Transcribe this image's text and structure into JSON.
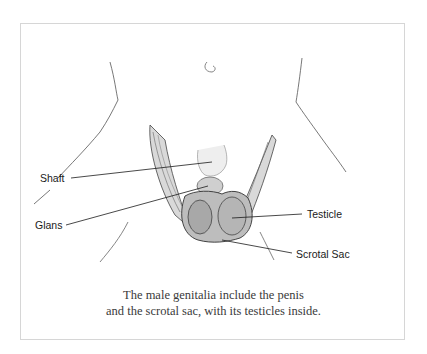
{
  "figure": {
    "labels": {
      "shaft": "Shaft",
      "glans": "Glans",
      "testicle": "Testicle",
      "scrotal_sac": "Scrotal Sac"
    },
    "caption": {
      "line1": "The male genitalia include the penis",
      "line2": "and the scrotal sac, with its testicles inside."
    },
    "colors": {
      "border": "#d6d6d6",
      "line": "#1a1a1a",
      "caption_text": "#3a3a3a"
    }
  }
}
